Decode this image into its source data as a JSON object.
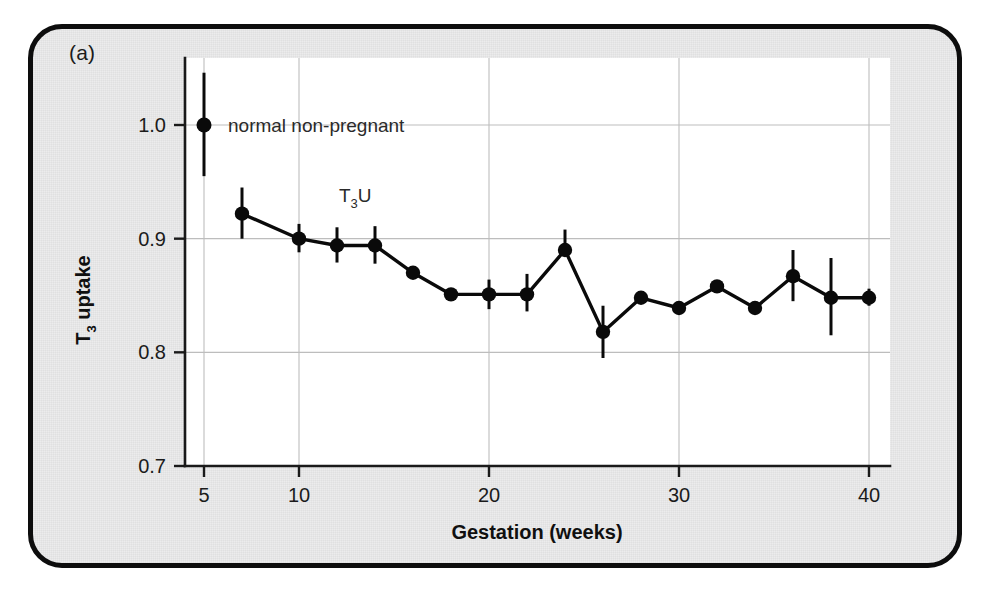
{
  "figure": {
    "panel_label": "(a)",
    "border_color": "#0d0d0d",
    "panel_bg": "#ececed",
    "plot_bg": "#ffffff",
    "series_color": "#0a0a0a",
    "grid_color": "#bdbdbd"
  },
  "chart_data": {
    "type": "line",
    "title": "",
    "subtitle": "",
    "xlabel": "Gestation (weeks)",
    "ylabel": "T3 uptake",
    "ylabel_parts": {
      "pre": "T",
      "sub": "3",
      "post": " uptake"
    },
    "xlim": [
      4,
      41
    ],
    "ylim": [
      0.7,
      1.035
    ],
    "xticks": [
      5,
      10,
      20,
      30,
      40
    ],
    "xtick_labels": [
      "5",
      "10",
      "20",
      "30",
      "40"
    ],
    "yticks": [
      0.7,
      0.8,
      0.9,
      1.0
    ],
    "ytick_labels": [
      "0.7",
      "0.8",
      "0.9",
      "1.0"
    ],
    "grid": "both",
    "legend": "none",
    "error_bars": "vertical",
    "annotations": [
      {
        "text": "normal non-pregnant",
        "x": 7.6,
        "y": 1.0
      },
      {
        "text": "T3U",
        "parts": {
          "pre": "T",
          "sub": "3",
          "post": "U"
        },
        "x": 14.2,
        "y": 0.945
      }
    ],
    "reference_point": {
      "name": "normal non-pregnant",
      "x": 5,
      "y": 1.0,
      "err_low": 0.955,
      "err_high": 1.046
    },
    "x": [
      7,
      10,
      12,
      14,
      16,
      18,
      20,
      22,
      24,
      26,
      28,
      30,
      32,
      34,
      36,
      38,
      40
    ],
    "values": [
      0.922,
      0.9,
      0.894,
      0.894,
      0.87,
      0.851,
      0.851,
      0.851,
      0.89,
      0.818,
      0.848,
      0.839,
      0.858,
      0.839,
      0.867,
      0.848,
      0.848
    ],
    "err_low": [
      0.9,
      0.888,
      0.879,
      0.878,
      0.87,
      0.851,
      0.838,
      0.836,
      0.89,
      0.795,
      0.848,
      0.839,
      0.858,
      0.839,
      0.845,
      0.815,
      0.841
    ],
    "err_high": [
      0.945,
      0.913,
      0.91,
      0.911,
      0.87,
      0.851,
      0.864,
      0.869,
      0.908,
      0.841,
      0.848,
      0.839,
      0.858,
      0.839,
      0.89,
      0.883,
      0.856
    ],
    "series": [
      {
        "name": "T3U",
        "values": [
          0.922,
          0.9,
          0.894,
          0.894,
          0.87,
          0.851,
          0.851,
          0.851,
          0.89,
          0.818,
          0.848,
          0.839,
          0.858,
          0.839,
          0.867,
          0.848,
          0.848
        ]
      }
    ]
  }
}
